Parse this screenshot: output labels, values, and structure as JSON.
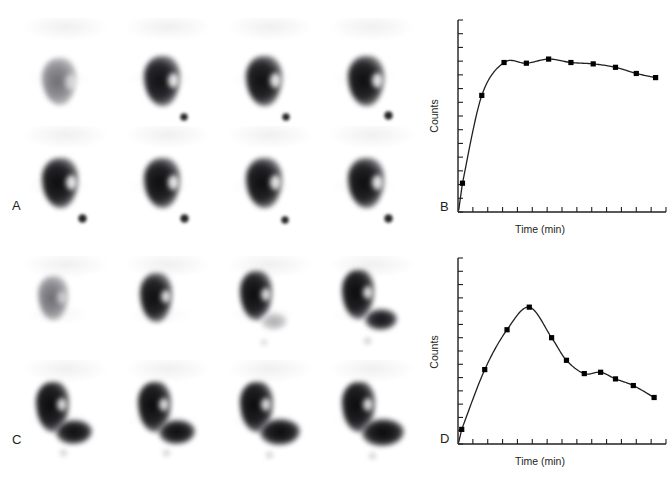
{
  "figure": {
    "background": "#ffffff",
    "ink": "#231f20"
  },
  "panels": {
    "a": {
      "letter": "A",
      "kind": "scintigram-grid",
      "description": "Normal renogram image series: progressive cortical uptake with prompt drainage; small focus of activity inferomedially (bladder/ureter).",
      "rows": 2,
      "cols": 4,
      "frames": [
        {
          "index": 1,
          "kidney_intensity": "faint",
          "bladder_dot": false
        },
        {
          "index": 2,
          "kidney_intensity": "dark",
          "bladder_dot": true
        },
        {
          "index": 3,
          "kidney_intensity": "dark",
          "bladder_dot": true
        },
        {
          "index": 4,
          "kidney_intensity": "dark",
          "bladder_dot": true
        },
        {
          "index": 5,
          "kidney_intensity": "dark",
          "bladder_dot": true
        },
        {
          "index": 6,
          "kidney_intensity": "dark",
          "bladder_dot": true
        },
        {
          "index": 7,
          "kidney_intensity": "dark",
          "bladder_dot": true
        },
        {
          "index": 8,
          "kidney_intensity": "dark",
          "bladder_dot": true
        }
      ]
    },
    "c": {
      "letter": "C",
      "kind": "scintigram-grid",
      "description": "Obstructed system: progressive accumulation of tracer in a dilated collecting system inferolateral to the kidney, increasing across frames.",
      "rows": 2,
      "cols": 4,
      "frames": [
        {
          "index": 1,
          "kidney_intensity": "faint",
          "pelvis": "none"
        },
        {
          "index": 2,
          "kidney_intensity": "dark",
          "pelvis": "none"
        },
        {
          "index": 3,
          "kidney_intensity": "dark",
          "pelvis": "faint"
        },
        {
          "index": 4,
          "kidney_intensity": "dark",
          "pelvis": "moderate"
        },
        {
          "index": 5,
          "kidney_intensity": "dark",
          "pelvis": "large"
        },
        {
          "index": 6,
          "kidney_intensity": "dark",
          "pelvis": "large"
        },
        {
          "index": 7,
          "kidney_intensity": "dark",
          "pelvis": "large"
        },
        {
          "index": 8,
          "kidney_intensity": "dark",
          "pelvis": "large"
        }
      ]
    }
  },
  "chart_data": [
    {
      "id": "b",
      "letter": "B",
      "type": "line",
      "title": "",
      "xlabel": "Time (min)",
      "ylabel": "Counts",
      "grid": false,
      "legend": null,
      "axis_color": "#231f20",
      "marker": "square",
      "marker_color": "#000000",
      "line_color": "#231f20",
      "x_ticks": 14,
      "y_ticks": 14,
      "xlim": [
        0,
        14
      ],
      "ylim": [
        0,
        14
      ],
      "annotation": "Normal curve: rapid rrise to plateau followed by slow decline",
      "x": [
        0.3,
        1.6,
        3.1,
        4.6,
        6.1,
        7.6,
        9.1,
        10.6,
        12.0,
        13.3
      ],
      "y": [
        2.1,
        8.5,
        10.9,
        10.85,
        11.15,
        10.9,
        10.8,
        10.55,
        10.1,
        9.8
      ]
    },
    {
      "id": "d",
      "letter": "D",
      "type": "line",
      "title": "",
      "xlabel": "Time (min)",
      "ylabel": "Counts",
      "grid": false,
      "legend": null,
      "axis_color": "#231f20",
      "marker": "square",
      "marker_color": "#000000",
      "line_color": "#231f20",
      "x_ticks": 14,
      "y_ticks": 14,
      "xlim": [
        0,
        14
      ],
      "ylim": [
        0,
        14
      ],
      "annotation": "Obstructed curve: delayed peak then progressive washout",
      "x": [
        0.25,
        1.8,
        3.3,
        4.8,
        6.3,
        7.3,
        8.5,
        9.6,
        10.6,
        11.8,
        13.2
      ],
      "y": [
        1.1,
        5.6,
        8.6,
        10.3,
        8.0,
        6.3,
        5.3,
        5.4,
        4.9,
        4.4,
        3.5
      ]
    }
  ],
  "caption": {
    "text": ""
  }
}
